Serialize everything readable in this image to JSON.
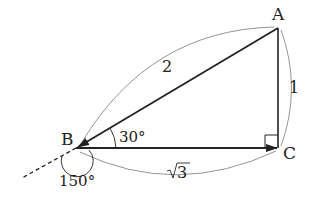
{
  "diagram": {
    "vertices": {
      "A": {
        "label": "A"
      },
      "B": {
        "label": "B"
      },
      "C": {
        "label": "C"
      }
    },
    "sides": {
      "AB": "2",
      "AC": "1",
      "BC_radicand": "3"
    },
    "angles": {
      "B_interior": "30°",
      "B_exterior": "150°"
    },
    "right_angle_at": "C",
    "colors": {
      "line": "#222222",
      "arc": "#888888",
      "background": "#ffffff"
    }
  }
}
